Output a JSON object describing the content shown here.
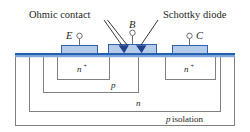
{
  "figure": {
    "type": "semiconductor-cross-section",
    "annotations": {
      "ohmic_contact": "Ohmic contact",
      "schottky_diode": "Schottky diode"
    },
    "terminals": [
      {
        "id": "emitter",
        "label": "E"
      },
      {
        "id": "base",
        "label": "B"
      },
      {
        "id": "collector",
        "label": "C"
      }
    ],
    "regions": [
      {
        "id": "emitter-nplus",
        "label": "n",
        "sup": "+"
      },
      {
        "id": "collector-nplus",
        "label": "n",
        "sup": "+"
      },
      {
        "id": "base-p",
        "label": "p",
        "sup": ""
      },
      {
        "id": "collector-n",
        "label": "n",
        "sup": ""
      }
    ],
    "substrate": {
      "label_italic": "p",
      "label_rest": " isolation"
    },
    "colors": {
      "surface_band": "#1f5fb4",
      "surface_band_light": "#7fa6d8",
      "metal_fill": "#b6cbe8",
      "metal_stroke": "#2f63ad",
      "schottky_wedge": "#20418c",
      "outline": "#808080",
      "lead": "#6d6d6d",
      "text": "#231f20"
    }
  }
}
